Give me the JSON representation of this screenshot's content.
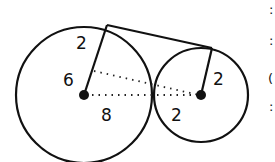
{
  "diagram": {
    "type": "two tangent circles with common external tangent segment",
    "large_circle": {
      "center": [
        84,
        95
      ],
      "radius_px": 68,
      "stroke": "#111111"
    },
    "small_circle": {
      "center": [
        201,
        95
      ],
      "radius_px": 47,
      "stroke": "#111111"
    },
    "tangent_segment": {
      "from": [
        107,
        25
      ],
      "to": [
        212,
        48
      ]
    },
    "labels": {
      "large_radius_upper": "2",
      "large_radius_lower": "6",
      "center_distance_large": "8",
      "center_distance_small": "2",
      "small_radius": "2"
    },
    "edge_fragments": [
      ":",
      ":",
      "(",
      ":"
    ]
  }
}
